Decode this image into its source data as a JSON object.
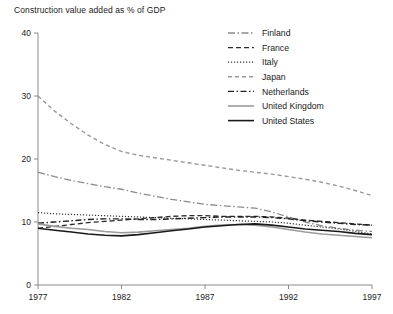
{
  "chart_data": {
    "type": "line",
    "title": "Construction value added as % of GDP",
    "xlabel": "",
    "ylabel": "",
    "xlim": [
      1977,
      1997
    ],
    "ylim": [
      0,
      40
    ],
    "xticks": [
      1977,
      1982,
      1987,
      1992,
      1997
    ],
    "yticks": [
      0,
      10,
      20,
      30,
      40
    ],
    "grid": false,
    "legend_position": "top-right",
    "x": [
      1977,
      1978,
      1979,
      1980,
      1981,
      1982,
      1983,
      1984,
      1985,
      1986,
      1987,
      1988,
      1989,
      1990,
      1991,
      1992,
      1993,
      1994,
      1995,
      1996,
      1997
    ],
    "series": [
      {
        "name": "Finland",
        "color": "#8a8a8a",
        "dash": "dash-dot-dot",
        "width": 1.3,
        "values": [
          17.9,
          17.2,
          16.6,
          16.1,
          15.6,
          15.2,
          14.6,
          14.1,
          13.6,
          13.2,
          12.8,
          12.6,
          12.4,
          12.2,
          11.6,
          10.8,
          10.0,
          9.4,
          9.0,
          8.7,
          8.5
        ]
      },
      {
        "name": "France",
        "color": "#2b2b2b",
        "dash": "dash",
        "width": 1.3,
        "values": [
          9.0,
          9.3,
          9.6,
          9.9,
          10.1,
          10.3,
          10.5,
          10.7,
          10.9,
          11.0,
          11.0,
          10.9,
          10.9,
          10.9,
          10.8,
          10.6,
          10.3,
          10.1,
          9.9,
          9.7,
          9.5
        ]
      },
      {
        "name": "Italy",
        "color": "#333333",
        "dash": "dot",
        "width": 1.2,
        "values": [
          11.5,
          11.3,
          11.2,
          11.1,
          11.0,
          10.9,
          10.8,
          10.7,
          10.6,
          10.5,
          10.4,
          10.3,
          10.2,
          10.1,
          10.0,
          9.8,
          9.5,
          9.2,
          8.9,
          8.5,
          8.1
        ]
      },
      {
        "name": "Japan",
        "color": "#9a9a9a",
        "dash": "dash-long",
        "width": 1.4,
        "values": [
          30.0,
          27.6,
          25.6,
          23.8,
          22.3,
          21.2,
          20.6,
          20.2,
          19.8,
          19.4,
          19.0,
          18.6,
          18.2,
          17.9,
          17.6,
          17.2,
          16.8,
          16.3,
          15.7,
          15.0,
          14.2
        ]
      },
      {
        "name": "Netherlands",
        "color": "#222222",
        "dash": "dash-dot",
        "width": 1.4,
        "values": [
          9.8,
          10.0,
          10.2,
          10.4,
          10.5,
          10.5,
          10.4,
          10.4,
          10.5,
          10.6,
          10.7,
          10.8,
          10.8,
          10.8,
          10.7,
          10.5,
          10.2,
          10.0,
          9.8,
          9.6,
          9.5
        ]
      },
      {
        "name": "United Kingdom",
        "color": "#9a9a9a",
        "dash": "solid",
        "width": 1.6,
        "values": [
          9.7,
          9.3,
          9.0,
          8.8,
          8.5,
          8.3,
          8.4,
          8.6,
          8.8,
          9.0,
          9.3,
          9.5,
          9.6,
          9.5,
          9.2,
          8.8,
          8.4,
          8.1,
          7.9,
          7.7,
          7.5
        ]
      },
      {
        "name": "United States",
        "color": "#1a1a1a",
        "dash": "solid",
        "width": 1.6,
        "values": [
          9.0,
          8.7,
          8.4,
          8.1,
          7.9,
          7.8,
          8.0,
          8.3,
          8.6,
          8.9,
          9.2,
          9.4,
          9.6,
          9.7,
          9.5,
          9.2,
          8.9,
          8.7,
          8.5,
          8.2,
          8.0
        ]
      }
    ]
  }
}
